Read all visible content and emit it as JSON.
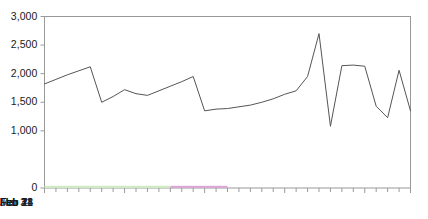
{
  "chart_data": {
    "type": "line",
    "title": "",
    "subtitle": "",
    "xlabel": "",
    "ylabel": "",
    "ylim": [
      0,
      3000
    ],
    "ytick_labels": [
      "0",
      "1,000",
      "1,500",
      "2,000",
      "2,500",
      "3,000"
    ],
    "ytick_values": [
      0,
      1000,
      1500,
      2000,
      2500,
      3000
    ],
    "xtick_labels": [
      "Jan 31",
      "Feb 7",
      "Feb 14",
      "Feb 21",
      "Feb 28",
      "Mar 4"
    ],
    "xtick_values": [
      0,
      7,
      14,
      21,
      28,
      32
    ],
    "x_minor_tick_interval_days": 1,
    "x_range_days": [
      0,
      32
    ],
    "grid": false,
    "legend": null,
    "legend_position": "none",
    "line_color": "#555555",
    "line_width": 1,
    "frame_color": "#999999",
    "background": "#ffffff",
    "x": [
      0,
      1,
      2,
      3,
      4,
      5,
      6,
      7,
      8,
      9,
      10,
      11,
      12,
      13,
      14,
      15,
      16,
      17,
      18,
      19,
      20,
      21,
      22,
      23,
      24,
      25,
      26,
      27,
      28,
      29,
      30,
      31,
      32
    ],
    "values": [
      1820,
      1900,
      1980,
      2050,
      2120,
      1500,
      1600,
      1720,
      1650,
      1620,
      1700,
      1780,
      1860,
      1950,
      1350,
      1380,
      1390,
      1420,
      1450,
      1500,
      1560,
      1640,
      1700,
      1950,
      2700,
      1080,
      2140,
      2150,
      2130,
      1430,
      1230,
      2060,
      1350
    ],
    "series": [
      {
        "name": "value",
        "values": [
          1820,
          1900,
          1980,
          2050,
          2120,
          1500,
          1600,
          1720,
          1650,
          1620,
          1700,
          1780,
          1860,
          1950,
          1350,
          1380,
          1390,
          1420,
          1450,
          1500,
          1560,
          1640,
          1700,
          1950,
          2700,
          1080,
          2140,
          2150,
          2130,
          1430,
          1230,
          2060,
          1350
        ]
      }
    ],
    "axis_highlight_bands": [
      {
        "name": "green-band",
        "start_day": 0,
        "end_day": 11,
        "color": "#cdeac4"
      },
      {
        "name": "purple-band",
        "start_day": 11,
        "end_day": 16,
        "color": "#d9a8d4"
      }
    ],
    "notes": {
      "peak_label": "2,700",
      "trough_label": "1,080"
    }
  }
}
